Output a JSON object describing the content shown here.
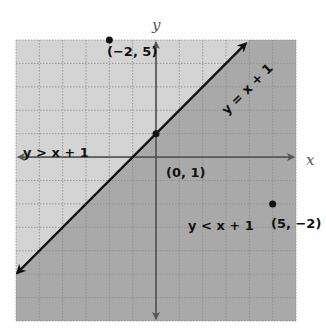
{
  "chart_data": {
    "type": "line",
    "title": "",
    "xlabel": "x",
    "ylabel": "y",
    "xlim": [
      -6,
      6
    ],
    "ylim": [
      -7,
      5
    ],
    "grid": true,
    "grid_step": 1,
    "boundary_line": {
      "equation": "y = x + 1",
      "slope": 1,
      "intercept": 1,
      "style": "solid",
      "arrows": "both"
    },
    "regions": [
      {
        "label": "y > x + 1",
        "position": "above-left",
        "shade": "#d4d4d4"
      },
      {
        "label": "y < x + 1",
        "position": "below-right",
        "shade": "#a9a9a9"
      }
    ],
    "points": [
      {
        "x": -2,
        "y": 5,
        "label": "(−2, 5)"
      },
      {
        "x": 0,
        "y": 1,
        "label": "(0, 1)"
      },
      {
        "x": 5,
        "y": -2,
        "label": "(5, −2)"
      }
    ],
    "colors": {
      "upper_region": "#d4d4d4",
      "lower_region": "#a9a9a9",
      "grid": "#8a8a8a",
      "axes": "#555555",
      "line": "#111111"
    }
  },
  "labels": {
    "x_axis": "x",
    "y_axis": "y",
    "line_label": "y = x + 1",
    "upper_region": "y > x + 1",
    "lower_region": "y < x + 1",
    "point_a": "(−2, 5)",
    "point_b": "(0, 1)",
    "point_c": "(5, −2)"
  }
}
